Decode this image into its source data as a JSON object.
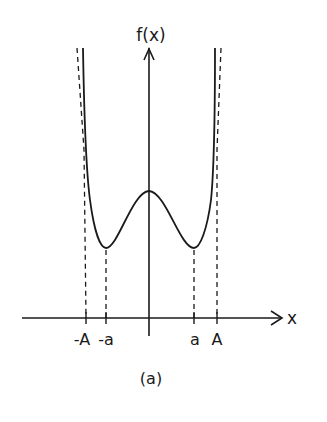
{
  "figure": {
    "caption": "(a)",
    "y_axis_label": "f(x)",
    "x_axis_label": "x",
    "ticks": [
      {
        "id": "neg-A",
        "label": "-A"
      },
      {
        "id": "neg-a",
        "label": "-a"
      },
      {
        "id": "pos-a",
        "label": "a"
      },
      {
        "id": "pos-A",
        "label": "A"
      }
    ]
  },
  "colors": {
    "ink": "#1a1a1a",
    "background": "#ffffff"
  }
}
